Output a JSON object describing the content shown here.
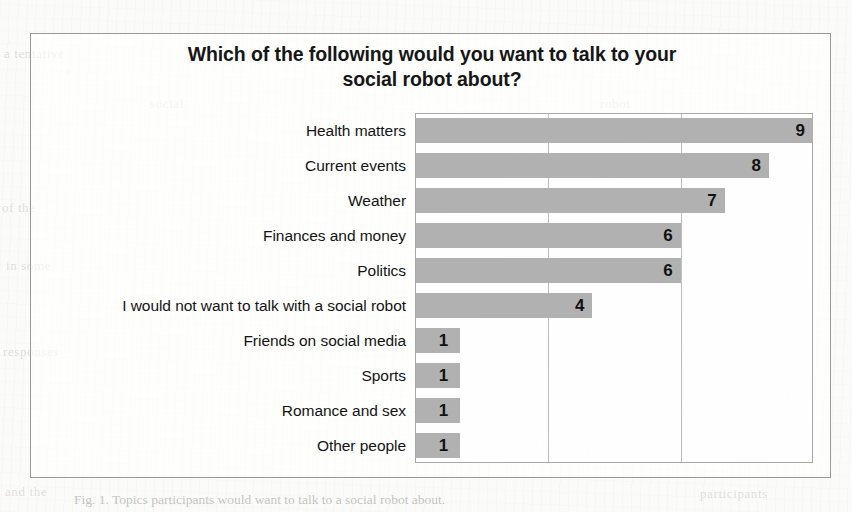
{
  "chart": {
    "title_line1": "Which of the following would you want to talk to your",
    "title_line2": "social robot about?"
  },
  "caption": {
    "text": "Fig. 1. Topics participants would want to talk to a social robot about."
  },
  "artifacts": {
    "ghost1": "a tentative",
    "ghost2": "of the",
    "ghost3": "in some",
    "ghost4": "responses",
    "ghost5": "robot",
    "ghost6": "social",
    "ghost7": "and the",
    "ghost8": "participants"
  },
  "chart_data": {
    "type": "bar",
    "orientation": "horizontal",
    "title": "Which of the following would you want to talk to your social robot about?",
    "xlabel": "",
    "ylabel": "",
    "xlim": [
      0,
      9
    ],
    "gridlines": [
      3,
      6
    ],
    "grid": true,
    "legend": false,
    "value_labels": true,
    "bar_color": "#b1b1b1",
    "categories": [
      "Health matters",
      "Current events",
      "Weather",
      "Finances and money",
      "Politics",
      "I would not want to talk with a social robot",
      "Friends on social media",
      "Sports",
      "Romance and sex",
      "Other people"
    ],
    "values": [
      9,
      8,
      7,
      6,
      6,
      4,
      1,
      1,
      1,
      1
    ]
  }
}
